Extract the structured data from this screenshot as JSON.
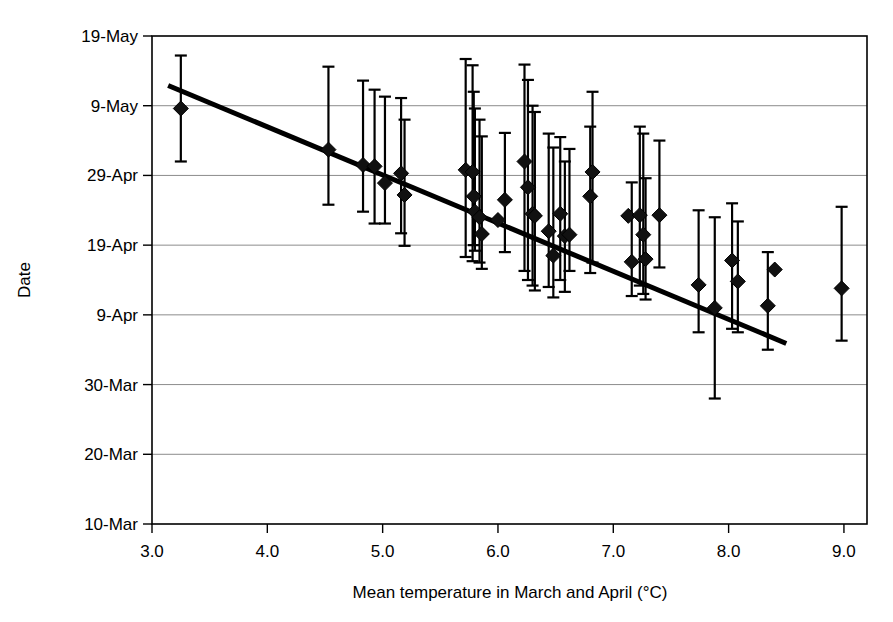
{
  "chart_data": {
    "type": "scatter",
    "title": "",
    "xlabel": "Mean temperature in March and April (°C)",
    "ylabel": "Date",
    "grid": "horizontal",
    "legend": "none",
    "xlim": [
      3.0,
      9.2
    ],
    "xticks": [
      "3.0",
      "4.0",
      "5.0",
      "6.0",
      "7.0",
      "8.0",
      "9.0"
    ],
    "xtick_values": [
      3.0,
      4.0,
      5.0,
      6.0,
      7.0,
      8.0,
      9.0
    ],
    "ylim_days": [
      69,
      139
    ],
    "yticks": [
      "10-Mar",
      "20-Mar",
      "30-Mar",
      "9-Apr",
      "19-Apr",
      "29-Apr",
      "9-May",
      "19-May"
    ],
    "ytick_values": [
      69,
      79,
      89,
      99,
      109,
      119,
      129,
      139
    ],
    "ytick_note": "day-of-year; 10-Mar=69, 19-May=139",
    "marker_shape": "diamond",
    "marker_color": "#111111",
    "errorbar_color": "#000000",
    "trendline": {
      "color": "#000000",
      "x_start": 3.14,
      "y_start": 131.9,
      "x_end": 8.5,
      "y_end": 94.9,
      "note": "fitted linear regression, negative slope"
    },
    "points": [
      {
        "x": 3.25,
        "y": 128.6,
        "ylow": 121.0,
        "yhigh": 136.2
      },
      {
        "x": 4.53,
        "y": 122.7,
        "ylow": 114.8,
        "yhigh": 134.6
      },
      {
        "x": 4.83,
        "y": 120.5,
        "ylow": 113.8,
        "yhigh": 132.6
      },
      {
        "x": 4.93,
        "y": 120.3,
        "ylow": 112.1,
        "yhigh": 131.3
      },
      {
        "x": 5.02,
        "y": 117.9,
        "ylow": 112.1,
        "yhigh": 130.3
      },
      {
        "x": 5.16,
        "y": 119.3,
        "ylow": 110.7,
        "yhigh": 130.1
      },
      {
        "x": 5.19,
        "y": 116.2,
        "ylow": 108.9,
        "yhigh": 127.0
      },
      {
        "x": 5.72,
        "y": 119.8,
        "ylow": 107.3,
        "yhigh": 135.7
      },
      {
        "x": 5.78,
        "y": 119.5,
        "ylow": 106.7,
        "yhigh": 134.8
      },
      {
        "x": 5.79,
        "y": 116.0,
        "ylow": 109.0,
        "yhigh": 131.0
      },
      {
        "x": 5.8,
        "y": 113.8,
        "ylow": 108.2,
        "yhigh": 128.6
      },
      {
        "x": 5.84,
        "y": 113.0,
        "ylow": 106.5,
        "yhigh": 127.0
      },
      {
        "x": 5.86,
        "y": 110.6,
        "ylow": 105.6,
        "yhigh": 124.6
      },
      {
        "x": 6.0,
        "y": 112.6,
        "ylow": 112.6,
        "yhigh": 112.6
      },
      {
        "x": 6.06,
        "y": 115.5,
        "ylow": 108.0,
        "yhigh": 125.1
      },
      {
        "x": 6.23,
        "y": 121.0,
        "ylow": 105.3,
        "yhigh": 134.9
      },
      {
        "x": 6.26,
        "y": 117.3,
        "ylow": 104.0,
        "yhigh": 132.7
      },
      {
        "x": 6.3,
        "y": 113.5,
        "ylow": 103.2,
        "yhigh": 129.0
      },
      {
        "x": 6.32,
        "y": 113.2,
        "ylow": 102.5,
        "yhigh": 128.1
      },
      {
        "x": 6.44,
        "y": 111.0,
        "ylow": 103.0,
        "yhigh": 125.0
      },
      {
        "x": 6.48,
        "y": 107.5,
        "ylow": 101.5,
        "yhigh": 123.0
      },
      {
        "x": 6.54,
        "y": 113.5,
        "ylow": 104.0,
        "yhigh": 124.5
      },
      {
        "x": 6.58,
        "y": 110.3,
        "ylow": 102.3,
        "yhigh": 121.0
      },
      {
        "x": 6.62,
        "y": 110.5,
        "ylow": 105.3,
        "yhigh": 122.8
      },
      {
        "x": 6.8,
        "y": 116.0,
        "ylow": 105.0,
        "yhigh": 126.0
      },
      {
        "x": 6.82,
        "y": 119.5,
        "ylow": 106.5,
        "yhigh": 131.0
      },
      {
        "x": 7.13,
        "y": 113.2,
        "ylow": 113.2,
        "yhigh": 113.2
      },
      {
        "x": 7.16,
        "y": 106.6,
        "ylow": 101.7,
        "yhigh": 118.0
      },
      {
        "x": 7.23,
        "y": 113.3,
        "ylow": 103.2,
        "yhigh": 126.0
      },
      {
        "x": 7.26,
        "y": 110.5,
        "ylow": 102.0,
        "yhigh": 125.0
      },
      {
        "x": 7.28,
        "y": 107.0,
        "ylow": 101.2,
        "yhigh": 118.6
      },
      {
        "x": 7.4,
        "y": 113.3,
        "ylow": 105.8,
        "yhigh": 124.0
      },
      {
        "x": 7.74,
        "y": 103.3,
        "ylow": 96.5,
        "yhigh": 114.0
      },
      {
        "x": 7.88,
        "y": 100.0,
        "ylow": 87.0,
        "yhigh": 113.0
      },
      {
        "x": 8.03,
        "y": 106.8,
        "ylow": 97.0,
        "yhigh": 115.0
      },
      {
        "x": 8.08,
        "y": 103.8,
        "ylow": 96.5,
        "yhigh": 112.4
      },
      {
        "x": 8.34,
        "y": 100.3,
        "ylow": 94.0,
        "yhigh": 108.0
      },
      {
        "x": 8.4,
        "y": 105.5,
        "ylow": 105.5,
        "yhigh": 105.5
      },
      {
        "x": 8.98,
        "y": 102.8,
        "ylow": 95.3,
        "yhigh": 114.5
      }
    ]
  }
}
